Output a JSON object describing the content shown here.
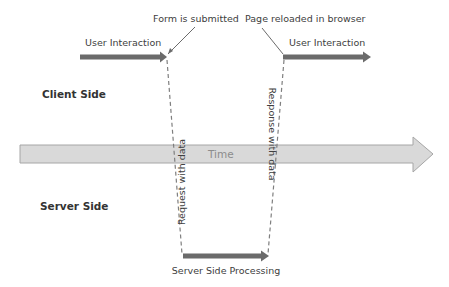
{
  "diagram": {
    "labels": {
      "form_submitted": "Form is submitted",
      "page_reloaded": "Page reloaded in browser",
      "user_interaction_left": "User Interaction",
      "user_interaction_right": "User Interaction",
      "client_side": "Client Side",
      "server_side": "Server Side",
      "time": "Time",
      "request": "Request with data",
      "response": "Response with data",
      "server_processing": "Server Side Processing"
    },
    "colors": {
      "dark_arrow": "#6b6b6b",
      "time_arrow_fill": "#d9d9d9",
      "time_arrow_stroke": "#a6a6a6",
      "dashed_line": "#7f7f7f",
      "text": "#404040"
    }
  }
}
